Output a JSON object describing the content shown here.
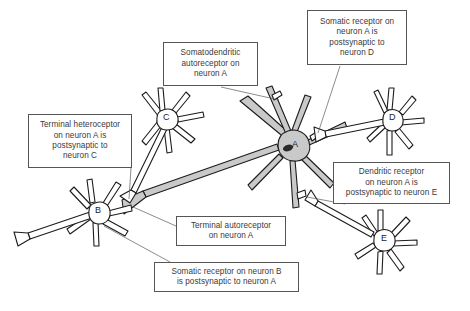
{
  "figure": {
    "type": "neuroscience-diagram",
    "background_color": "#ffffff",
    "line_color": "#1c1c1c",
    "soma_fill_highlight": "#c9c9c9",
    "text_color": "#3a3a3a",
    "box_border_color": "#555555"
  },
  "callouts": [
    {
      "id": "somatodendritic-autoreceptor",
      "text": "Somatodendritic\nautoreceptor on\nneuron A",
      "points_to": "neuron-a-dendrite"
    },
    {
      "id": "somatic-receptor-neuron-d",
      "text": "Somatic receptor on\nneuron A is\npostsynaptic to\nneuron D",
      "points_to": "neuron-a-soma"
    },
    {
      "id": "terminal-heteroceptor-neuron-c",
      "text": "Terminal heteroceptor\non neuron A is\npostsynaptic to\nneuron C",
      "points_to": "neuron-a-axon-terminal"
    },
    {
      "id": "dendritic-receptor-neuron-e",
      "text": "Dendritic receptor\non neuron A is\npostsynaptic to neuron E",
      "points_to": "neuron-a-dendrite-lower"
    },
    {
      "id": "terminal-autoreceptor",
      "text": "Terminal autoreceptor\non neuron A",
      "points_to": "neuron-a-axon-terminal"
    },
    {
      "id": "somatic-receptor-neuron-b",
      "text": "Somatic receptor on neuron B\nis postsynaptic to neuron A",
      "points_to": "neuron-b-soma"
    }
  ],
  "neurons": [
    {
      "id": "neuron-a",
      "label": "A",
      "role": "principal neuron, shaded soma"
    },
    {
      "id": "neuron-b",
      "label": "B",
      "role": "target neuron of neuron A axon"
    },
    {
      "id": "neuron-c",
      "label": "C",
      "role": "presynaptic to neuron A terminal"
    },
    {
      "id": "neuron-d",
      "label": "D",
      "role": "presynaptic to neuron A soma"
    },
    {
      "id": "neuron-e",
      "label": "E",
      "role": "presynaptic to neuron A dendrite"
    }
  ]
}
